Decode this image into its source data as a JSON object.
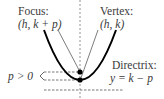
{
  "diagram": {
    "type": "parabola-focus-directrix",
    "focus": {
      "title": "Focus:",
      "coords": "(h, k + p)"
    },
    "vertex": {
      "title": "Vertex:",
      "coords": "(h, k)"
    },
    "directrix": {
      "title": "Directrix:",
      "equation": "y = k − p"
    },
    "p_label": "p > 0",
    "colors": {
      "curve": "#000000",
      "text": "#3a3a3a",
      "dashed": "#555555"
    }
  }
}
